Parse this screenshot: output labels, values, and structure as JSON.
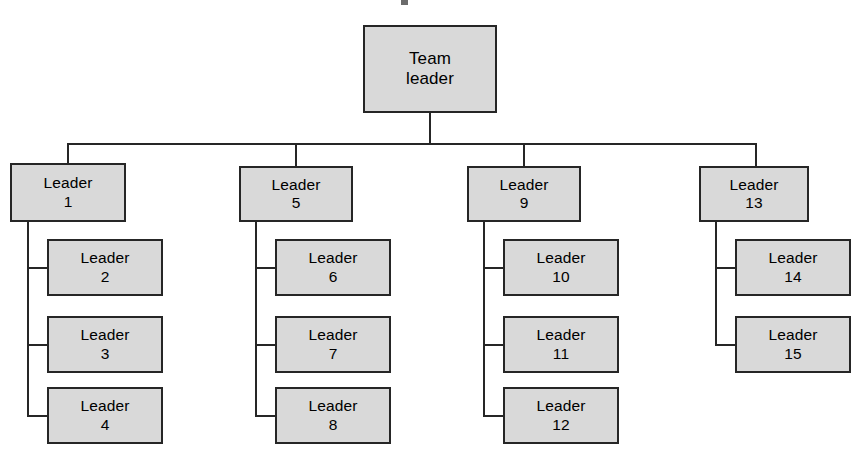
{
  "diagram": {
    "type": "organizational-chart",
    "style": {
      "node_fill": "#d9d9d9",
      "node_border": "#262626",
      "line_color": "#262626",
      "page_background": "#ffffff",
      "text_color": "#000000"
    },
    "root": {
      "id": "team-leader",
      "line1": "Team",
      "line2": "leader"
    },
    "branches": [
      {
        "id": "branch-1",
        "parent": {
          "id": "leader-1",
          "line1": "Leader",
          "line2": "1"
        },
        "children": [
          {
            "id": "leader-2",
            "line1": "Leader",
            "line2": "2"
          },
          {
            "id": "leader-3",
            "line1": "Leader",
            "line2": "3"
          },
          {
            "id": "leader-4",
            "line1": "Leader",
            "line2": "4"
          }
        ]
      },
      {
        "id": "branch-2",
        "parent": {
          "id": "leader-5",
          "line1": "Leader",
          "line2": "5"
        },
        "children": [
          {
            "id": "leader-6",
            "line1": "Leader",
            "line2": "6"
          },
          {
            "id": "leader-7",
            "line1": "Leader",
            "line2": "7"
          },
          {
            "id": "leader-8",
            "line1": "Leader",
            "line2": "8"
          }
        ]
      },
      {
        "id": "branch-3",
        "parent": {
          "id": "leader-9",
          "line1": "Leader",
          "line2": "9"
        },
        "children": [
          {
            "id": "leader-10",
            "line1": "Leader",
            "line2": "10"
          },
          {
            "id": "leader-11",
            "line1": "Leader",
            "line2": "11"
          },
          {
            "id": "leader-12",
            "line1": "Leader",
            "line2": "12"
          }
        ]
      },
      {
        "id": "branch-4",
        "parent": {
          "id": "leader-13",
          "line1": "Leader",
          "line2": "13"
        },
        "children": [
          {
            "id": "leader-14",
            "line1": "Leader",
            "line2": "14"
          },
          {
            "id": "leader-15",
            "line1": "Leader",
            "line2": "15"
          }
        ]
      }
    ]
  }
}
